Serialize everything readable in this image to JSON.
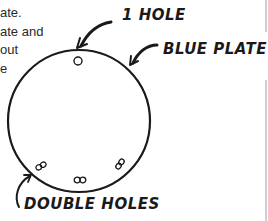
{
  "document_text": {
    "lines": [
      "ate.",
      "ate and",
      " out",
      "e"
    ]
  },
  "diagram": {
    "labels": {
      "one_hole": "1 HOLE",
      "blue_plate": "BLUE PLATE",
      "double_holes": "DOUBLE HOLES"
    },
    "plate": {
      "cx": 79,
      "cy": 121,
      "r": 71,
      "stroke": "#1a1a1a"
    },
    "holes": {
      "single": [
        {
          "cx": 78,
          "cy": 61
        }
      ],
      "double": [
        {
          "cx": 41,
          "cy": 166
        },
        {
          "cx": 80,
          "cy": 180
        },
        {
          "cx": 120,
          "cy": 164
        }
      ]
    }
  }
}
